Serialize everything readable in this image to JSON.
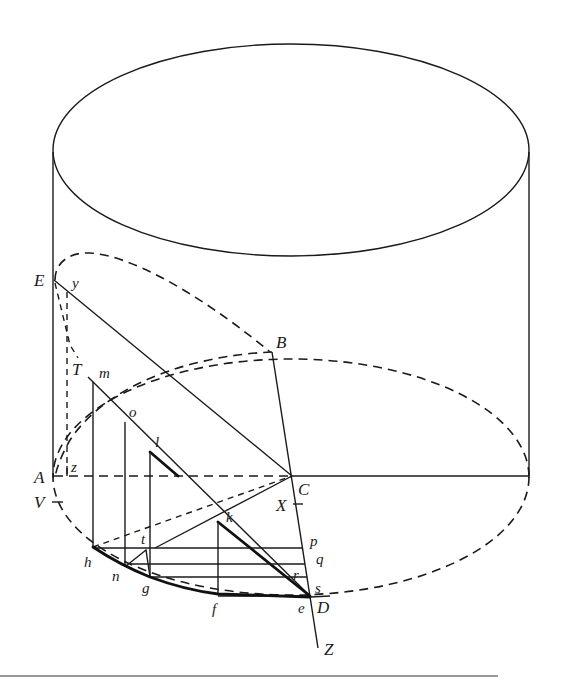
{
  "figure": {
    "points": {
      "A": "A",
      "B": "B",
      "C": "C",
      "D": "D",
      "E": "E",
      "T": "T",
      "V": "V",
      "X": "X",
      "Z": "Z",
      "y": "y",
      "z": "z",
      "m": "m",
      "o": "o",
      "l": "l",
      "k": "k",
      "h": "h",
      "n": "n",
      "g": "g",
      "f": "f",
      "e": "e",
      "t": "t",
      "p": "p",
      "q": "q",
      "r": "r",
      "s": "s"
    }
  }
}
